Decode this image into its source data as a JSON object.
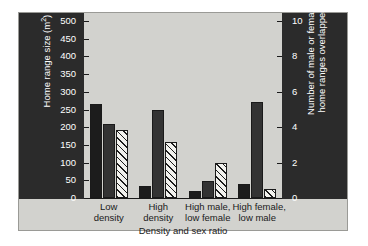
{
  "chart_data": {
    "type": "bar",
    "title": "",
    "xlabel": "Density and sex ratio",
    "ylabel": "Home range size (m",
    "ylabel_sup": "2",
    "ylabel_suffix": ")",
    "ylabel_right_line1": "Number of male or female",
    "ylabel_right_line2": "home ranges overlapped",
    "categories": [
      "Low\ndensity",
      "High\ndensity",
      "High male,\nlow female",
      "High female,\nlow male"
    ],
    "category_lines": [
      [
        "Low",
        "density"
      ],
      [
        "High",
        "density"
      ],
      [
        "High male,",
        "low female"
      ],
      [
        "High female,",
        "low male"
      ]
    ],
    "series": [
      {
        "name": "male home range size",
        "style": "solid-black",
        "axis": "left",
        "values": [
          265,
          33,
          20,
          40
        ]
      },
      {
        "name": "female home range size",
        "style": "solid-dark",
        "axis": "left",
        "values": [
          210,
          248,
          47,
          272
        ]
      },
      {
        "name": "number of home ranges overlapped",
        "style": "hatched",
        "axis": "right",
        "values_left_scale": [
          192,
          158,
          98,
          25
        ],
        "values": [
          3.84,
          3.16,
          1.96,
          0.5
        ]
      }
    ],
    "ylim": [
      0,
      500
    ],
    "yticks": [
      0,
      50,
      100,
      150,
      200,
      250,
      300,
      350,
      400,
      450,
      500
    ],
    "ylim_right": [
      0,
      10
    ],
    "yticks_right": [
      0,
      2,
      4,
      6,
      8,
      10
    ],
    "grid": false,
    "legend": "none"
  },
  "colors": {
    "page_background": "#ffffff",
    "panel_background": "#2b2b2b",
    "plot_background": "#d2d2ce",
    "axis_line": "#1a1a1a",
    "bar_black": "#1c1c1c",
    "bar_dark": "#333333",
    "bar_hatch_fill": "#f2f2ee",
    "tick_text": "#ffffff",
    "label_text": "#1a1a1a"
  }
}
